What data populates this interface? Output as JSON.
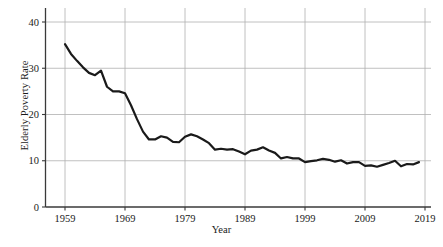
{
  "chart_data": {
    "type": "line",
    "title": "",
    "xlabel": "Year",
    "ylabel": "Elderly Poverty Rate",
    "xlim": [
      1959,
      2019
    ],
    "ylim": [
      0,
      43
    ],
    "grid": true,
    "legend": null,
    "line_color": "#1a1a1a",
    "grid_color": "#b0b0b0",
    "axis_color": "#3a3a3a",
    "background": "#ffffff",
    "ytick_values": [
      0,
      10,
      20,
      30,
      40
    ],
    "ytick_labels": [
      "0",
      "10",
      "20",
      "30",
      "40"
    ],
    "xtick_values": [
      1959,
      1969,
      1979,
      1989,
      1999,
      2009,
      2019
    ],
    "xtick_labels": [
      "1959",
      "1969",
      "1979",
      "1989",
      "1999",
      "2009",
      "2019"
    ],
    "x": [
      1959,
      1960,
      1961,
      1962,
      1963,
      1964,
      1965,
      1966,
      1967,
      1968,
      1969,
      1970,
      1971,
      1972,
      1973,
      1974,
      1975,
      1976,
      1977,
      1978,
      1979,
      1980,
      1981,
      1982,
      1983,
      1984,
      1985,
      1986,
      1987,
      1988,
      1989,
      1990,
      1991,
      1992,
      1993,
      1994,
      1995,
      1996,
      1997,
      1998,
      1999,
      2000,
      2001,
      2002,
      2003,
      2004,
      2005,
      2006,
      2007,
      2008,
      2009,
      2010,
      2011,
      2012,
      2013,
      2014,
      2015,
      2016,
      2017,
      2018
    ],
    "values": [
      35.2,
      33.1,
      31.6,
      30.2,
      29.0,
      28.5,
      29.5,
      26.0,
      25.0,
      25.0,
      24.6,
      22.0,
      19.0,
      16.3,
      14.6,
      14.6,
      15.3,
      15.0,
      14.1,
      14.0,
      15.2,
      15.7,
      15.3,
      14.6,
      13.8,
      12.4,
      12.6,
      12.4,
      12.5,
      12.0,
      11.4,
      12.2,
      12.4,
      12.9,
      12.2,
      11.7,
      10.5,
      10.8,
      10.5,
      10.5,
      9.7,
      9.9,
      10.1,
      10.4,
      10.2,
      9.8,
      10.1,
      9.4,
      9.7,
      9.7,
      8.9,
      9.0,
      8.7,
      9.1,
      9.5,
      10.0,
      8.8,
      9.3,
      9.2,
      9.7
    ],
    "series_name": "Elderly Poverty Rate"
  }
}
